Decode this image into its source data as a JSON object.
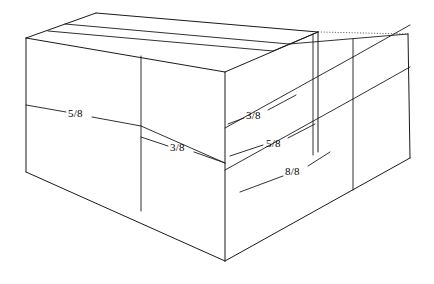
{
  "figure": {
    "type": "technical-line-drawing",
    "background_color": "#ffffff",
    "line_color": "#1a1a1a",
    "hidden_line_color": "#555555",
    "labels": [
      {
        "id": "left-face-upper",
        "text": "5/8",
        "x": 68,
        "y": 108
      },
      {
        "id": "left-face-lower",
        "text": "3/8",
        "x": 170,
        "y": 142
      },
      {
        "id": "right-face-top",
        "text": "3/8",
        "x": 246,
        "y": 110
      },
      {
        "id": "right-face-middle",
        "text": "5/8",
        "x": 266,
        "y": 138
      },
      {
        "id": "right-face-bottom",
        "text": "8/8",
        "x": 285,
        "y": 166
      }
    ],
    "geometry": {
      "vertices": {
        "top_left_front": [
          26,
          38
        ],
        "top_front": [
          225,
          72
        ],
        "top_back_left": [
          96,
          13
        ],
        "top_back_right": [
          318,
          32
        ],
        "top_right_far": [
          408,
          34
        ],
        "bottom_left": [
          26,
          172
        ],
        "bottom_front": [
          225,
          261
        ],
        "bottom_right_far": [
          410,
          158
        ]
      },
      "front_left_face_divider_x": 141,
      "right_face_divider_x": [
        313,
        353
      ],
      "hidden_edge": "top-back-right to top-right-far"
    }
  }
}
